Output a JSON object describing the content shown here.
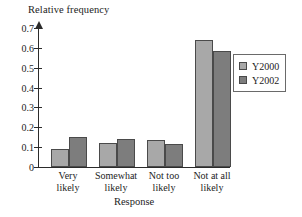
{
  "chart_data": {
    "type": "bar",
    "title": "",
    "subtitle": "",
    "xlabel": "Response",
    "ylabel": "Relative frequency",
    "categories": [
      "Very likely",
      "Somewhat likely",
      "Not too likely",
      "Not at all likely"
    ],
    "category_lines": [
      [
        "Very",
        "likely"
      ],
      [
        "Somewhat",
        "likely"
      ],
      [
        "Not too",
        "likely"
      ],
      [
        "Not at all",
        "likely"
      ]
    ],
    "series": [
      {
        "name": "Y2000",
        "color": "#a8a8a8",
        "values": [
          0.09,
          0.12,
          0.135,
          0.64
        ]
      },
      {
        "name": "Y2002",
        "color": "#7d7d7d",
        "values": [
          0.15,
          0.14,
          0.118,
          0.585
        ]
      }
    ],
    "ylim": [
      0,
      0.73
    ],
    "yticks": [
      0,
      0.1,
      0.2,
      0.3,
      0.4,
      0.5,
      0.6,
      0.7
    ],
    "ytick_labels": [
      "0",
      "0.1",
      "0.2",
      "0.3",
      "0.4",
      "0.5",
      "0.6",
      "0.7"
    ],
    "grid": false,
    "legend_position": "right",
    "axis_arrow": true
  },
  "legend": {
    "entries": [
      {
        "label": "Y2000"
      },
      {
        "label": "Y2002"
      }
    ]
  }
}
